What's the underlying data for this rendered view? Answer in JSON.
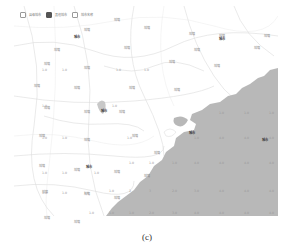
{
  "legend": {
    "items": [
      {
        "label": "县级城市",
        "checked": false
      },
      {
        "label": "其他城市",
        "checked": true
      },
      {
        "label": "城市名称",
        "checked": false
      }
    ]
  },
  "land_labels": [
    {
      "text": "城镇",
      "x": 70,
      "y": 22
    },
    {
      "text": "城镇",
      "x": 100,
      "y": 12
    },
    {
      "text": "城镇",
      "x": 130,
      "y": 20
    },
    {
      "text": "城镇",
      "x": 175,
      "y": 26
    },
    {
      "text": "城镇",
      "x": 205,
      "y": 28
    },
    {
      "text": "城镇",
      "x": 250,
      "y": 28
    },
    {
      "text": "城镇",
      "x": 40,
      "y": 42
    },
    {
      "text": "城镇",
      "x": 110,
      "y": 40
    },
    {
      "text": "城镇",
      "x": 180,
      "y": 42
    },
    {
      "text": "城镇",
      "x": 240,
      "y": 40
    },
    {
      "text": "城镇",
      "x": 30,
      "y": 56
    },
    {
      "text": "城镇",
      "x": 70,
      "y": 60
    },
    {
      "text": "城镇",
      "x": 155,
      "y": 54
    },
    {
      "text": "城镇",
      "x": 200,
      "y": 58
    },
    {
      "text": "城镇",
      "x": 20,
      "y": 78
    },
    {
      "text": "城镇",
      "x": 60,
      "y": 80
    },
    {
      "text": "城镇",
      "x": 115,
      "y": 80
    },
    {
      "text": "城镇",
      "x": 160,
      "y": 82
    },
    {
      "text": "城镇",
      "x": 30,
      "y": 100
    },
    {
      "text": "城镇",
      "x": 70,
      "y": 104
    },
    {
      "text": "城镇",
      "x": 105,
      "y": 104
    },
    {
      "text": "城镇",
      "x": 25,
      "y": 128
    },
    {
      "text": "城镇",
      "x": 70,
      "y": 132
    },
    {
      "text": "城镇",
      "x": 118,
      "y": 128
    },
    {
      "text": "城镇",
      "x": 140,
      "y": 145
    },
    {
      "text": "城镇",
      "x": 25,
      "y": 158
    },
    {
      "text": "城镇",
      "x": 60,
      "y": 162
    },
    {
      "text": "城镇",
      "x": 100,
      "y": 164
    },
    {
      "text": "城镇",
      "x": 130,
      "y": 168
    },
    {
      "text": "城镇",
      "x": 28,
      "y": 184
    },
    {
      "text": "城镇",
      "x": 70,
      "y": 186
    },
    {
      "text": "城镇",
      "x": 100,
      "y": 190
    },
    {
      "text": "城镇",
      "x": 30,
      "y": 210
    },
    {
      "text": "城镇",
      "x": 60,
      "y": 214
    }
  ],
  "cities": [
    {
      "text": "城市",
      "x": 60,
      "y": 28
    },
    {
      "text": "城市",
      "x": 205,
      "y": 30
    },
    {
      "text": "城市",
      "x": 87,
      "y": 102
    },
    {
      "text": "城市",
      "x": 72,
      "y": 158
    },
    {
      "text": "城市",
      "x": 175,
      "y": 124
    },
    {
      "text": "城市",
      "x": 248,
      "y": 131
    }
  ],
  "land_values": [
    {
      "text": "1.0",
      "x": 28,
      "y": 62
    },
    {
      "text": "1.0",
      "x": 48,
      "y": 62
    },
    {
      "text": "1.0",
      "x": 102,
      "y": 62
    },
    {
      "text": "1.0",
      "x": 130,
      "y": 62
    },
    {
      "text": "1.0",
      "x": 28,
      "y": 98
    },
    {
      "text": "1.0",
      "x": 98,
      "y": 98
    },
    {
      "text": "1.0",
      "x": 28,
      "y": 130
    },
    {
      "text": "1.0",
      "x": 48,
      "y": 130
    },
    {
      "text": "1.0",
      "x": 113,
      "y": 130
    },
    {
      "text": "1.0",
      "x": 28,
      "y": 165
    },
    {
      "text": "1.0",
      "x": 48,
      "y": 165
    },
    {
      "text": "1.0",
      "x": 80,
      "y": 165
    },
    {
      "text": "1.0",
      "x": 28,
      "y": 185
    },
    {
      "text": "1.0",
      "x": 48,
      "y": 185
    },
    {
      "text": "1.0",
      "x": 70,
      "y": 185
    }
  ],
  "sea_values": [
    {
      "text": "1.0",
      "x": 205,
      "y": 105
    },
    {
      "text": "1.0",
      "x": 230,
      "y": 105
    },
    {
      "text": "1.0",
      "x": 255,
      "y": 105
    },
    {
      "text": "1.0",
      "x": 180,
      "y": 130
    },
    {
      "text": "4.0",
      "x": 205,
      "y": 130
    },
    {
      "text": "4.0",
      "x": 230,
      "y": 130
    },
    {
      "text": "4.0",
      "x": 255,
      "y": 130
    },
    {
      "text": "1.0",
      "x": 115,
      "y": 155
    },
    {
      "text": "1.0",
      "x": 135,
      "y": 155
    },
    {
      "text": "1.0",
      "x": 158,
      "y": 155
    },
    {
      "text": "4.0",
      "x": 180,
      "y": 155
    },
    {
      "text": "4.0",
      "x": 205,
      "y": 155
    },
    {
      "text": "4.0",
      "x": 230,
      "y": 155
    },
    {
      "text": "4.0",
      "x": 255,
      "y": 155
    },
    {
      "text": "1.0",
      "x": 95,
      "y": 183
    },
    {
      "text": "2",
      "x": 115,
      "y": 183
    },
    {
      "text": "3",
      "x": 135,
      "y": 183
    },
    {
      "text": "2.0",
      "x": 158,
      "y": 183
    },
    {
      "text": "3.0",
      "x": 180,
      "y": 183
    },
    {
      "text": "4.0",
      "x": 205,
      "y": 183
    },
    {
      "text": "4.0",
      "x": 230,
      "y": 183
    },
    {
      "text": "4.0",
      "x": 255,
      "y": 183
    },
    {
      "text": "1.0",
      "x": 75,
      "y": 205
    },
    {
      "text": "1.0",
      "x": 95,
      "y": 205
    },
    {
      "text": "1.0",
      "x": 115,
      "y": 205
    },
    {
      "text": "2.0",
      "x": 135,
      "y": 205
    },
    {
      "text": "3.0",
      "x": 158,
      "y": 205
    },
    {
      "text": "4.0",
      "x": 180,
      "y": 205
    },
    {
      "text": "4.0",
      "x": 205,
      "y": 205
    },
    {
      "text": "4.0",
      "x": 230,
      "y": 205
    },
    {
      "text": "4.0",
      "x": 255,
      "y": 205
    }
  ],
  "colors": {
    "sea": "#b8b8b8",
    "land": "#ffffff",
    "road": "#d8d8d8"
  },
  "caption": "(c)"
}
